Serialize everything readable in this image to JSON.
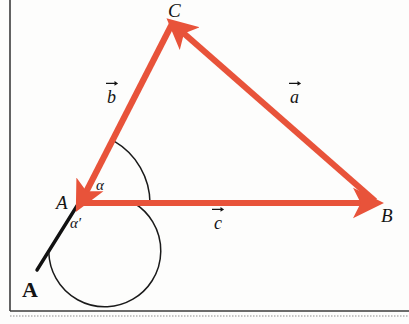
{
  "figure": {
    "caption": "A",
    "background_color": "#fdfdfc",
    "frame_color": "#3b3b3b",
    "vector_color": "#e8533a",
    "line_color": "#111111",
    "text_color": "#141414"
  },
  "vertices": [
    {
      "name": "A",
      "label": "A",
      "x": 78,
      "y": 203,
      "label_x": 56,
      "label_y": 195
    },
    {
      "name": "B",
      "label": "B",
      "x": 375,
      "y": 203,
      "label_x": 383,
      "label_y": 207
    },
    {
      "name": "C",
      "label": "C",
      "x": 172,
      "y": 22,
      "label_x": 172,
      "label_y": 2
    }
  ],
  "vectors": [
    {
      "name": "b",
      "label": "b",
      "from": "C",
      "to": "A",
      "label_x": 108,
      "label_y": 88
    },
    {
      "name": "c",
      "label": "c",
      "from": "A",
      "to": "B",
      "label_x": 214,
      "label_y": 214
    },
    {
      "name": "a",
      "label": "a",
      "from": "B",
      "to": "C",
      "label_x": 290,
      "label_y": 88
    }
  ],
  "angles": [
    {
      "name": "alpha",
      "label": "α",
      "label_x": 96,
      "label_y": 180,
      "vertex": "A"
    },
    {
      "name": "alpha-prime",
      "label": "α′",
      "label_x": 72,
      "label_y": 217,
      "vertex": "A"
    }
  ],
  "extension_line": {
    "name": "b-extension",
    "from_x": 78,
    "from_y": 203,
    "to_x": 37,
    "to_y": 270
  }
}
